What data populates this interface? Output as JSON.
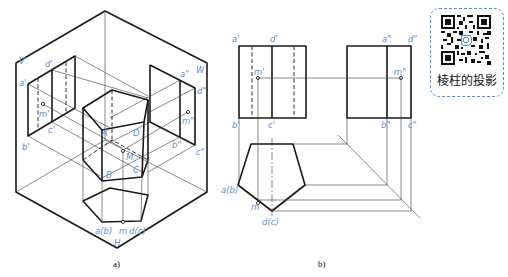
{
  "figure_a": {
    "caption": "a)",
    "planes": {
      "V": "V",
      "W": "W",
      "H": "H"
    },
    "front_labels": {
      "a1": "a'",
      "d1": "d'",
      "m1": "m'",
      "b1": "b'",
      "c1": "c'"
    },
    "side_labels": {
      "a2": "a\"",
      "d2": "d\"",
      "m2": "m\"",
      "b2": "b\"",
      "c2": "c\""
    },
    "solid_labels": {
      "A": "A",
      "B": "B",
      "C": "C",
      "D": "D",
      "M": "M"
    },
    "top_labels": {
      "ab": "a(b)",
      "m": "m",
      "dc": "d(c)"
    }
  },
  "figure_b": {
    "caption": "b)",
    "front_labels": {
      "a1": "a'",
      "d1": "d'",
      "m1": "m'",
      "b1": "b'",
      "c1": "c'"
    },
    "side_labels": {
      "a2": "a\"",
      "d2": "d\"",
      "m2": "m\"",
      "b2": "b\"",
      "c2": "c\""
    },
    "top_labels": {
      "ab": "a(b)",
      "m": "m",
      "dc": "d(c)"
    }
  },
  "qr_card": {
    "title": "棱柱的投影",
    "icon": "qr-code-icon",
    "border_color": "#5b8fc7"
  },
  "colors": {
    "label": "#5b8fc7",
    "line": "#1a1a1a"
  }
}
